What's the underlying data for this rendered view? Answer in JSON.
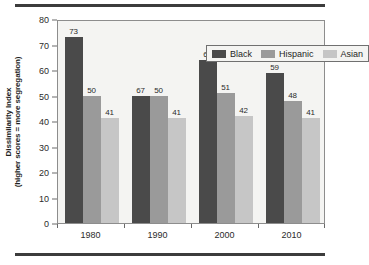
{
  "chart_data": {
    "type": "bar",
    "title": "",
    "subtitle": "",
    "xlabel": "",
    "ylabel_line1": "Dissimilarity Index",
    "ylabel_line2": "(higher scores = more segregation)",
    "categories": [
      "1980",
      "1990",
      "2000",
      "2010"
    ],
    "series": [
      {
        "name": "Black",
        "color": "#4a4a4a",
        "values": [
          73,
          50,
          64,
          59
        ]
      },
      {
        "name": "Hispanic",
        "color": "#9a9a9a",
        "values": [
          50,
          50,
          51,
          48
        ]
      },
      {
        "name": "Asian",
        "color": "#c6c6c6",
        "values": [
          41,
          41,
          42,
          41
        ]
      }
    ],
    "ylim": [
      0,
      80
    ],
    "ytick_labels": [
      "0",
      "10",
      "20",
      "30",
      "40",
      "50",
      "60",
      "70",
      "80"
    ],
    "ytick_values": [
      0,
      10,
      20,
      30,
      40,
      50,
      60,
      70,
      80
    ],
    "grid": false,
    "legend_position": "top-right-inside",
    "data_labels": [
      [
        "73",
        "50",
        "41"
      ],
      [
        "67",
        "50",
        "41"
      ],
      [
        "64",
        "51",
        "42"
      ],
      [
        "59",
        "48",
        "41"
      ]
    ]
  },
  "figure": {
    "top_rule": "divider",
    "bottom_rule": "divider",
    "plot_background": "#f4f4f2",
    "plot_border": "#8d8d8d"
  }
}
